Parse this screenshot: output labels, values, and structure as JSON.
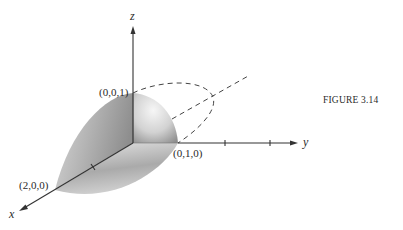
{
  "figure": {
    "caption": "FIGURE 3.14",
    "axes": {
      "x_label": "x",
      "y_label": "y",
      "z_label": "z"
    },
    "points": {
      "z_intercept": "(0,0,1)",
      "y_intercept": "(0,1,0)",
      "x_intercept": "(2,0,0)"
    },
    "colors": {
      "axis": "#333333",
      "solid_light": "#f4f4f4",
      "solid_dark": "#8a8a8a",
      "text": "#2a2a2a"
    }
  }
}
